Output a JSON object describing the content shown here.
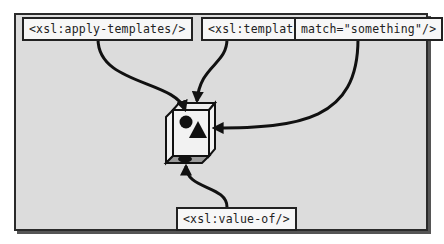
{
  "diagram": {
    "labels": {
      "apply_templates": "<xsl:apply-templates/>",
      "template_open": "<xsl:template",
      "template_match": "match=\"something\"/>",
      "value_of": "<xsl:value-of/>"
    },
    "node": {
      "shape": "cube",
      "face_symbols": [
        "circle",
        "triangle",
        "ellipse"
      ]
    },
    "edges": [
      {
        "from": "apply_templates",
        "to": "cube-circle"
      },
      {
        "from": "template_open",
        "to": "cube-circle"
      },
      {
        "from": "template_match",
        "to": "cube-triangle"
      },
      {
        "from": "value_of",
        "to": "cube-ellipse"
      }
    ],
    "colors": {
      "background": "#dcdcdc",
      "label_fill": "#f7f7f7",
      "stroke": "#111111"
    }
  }
}
